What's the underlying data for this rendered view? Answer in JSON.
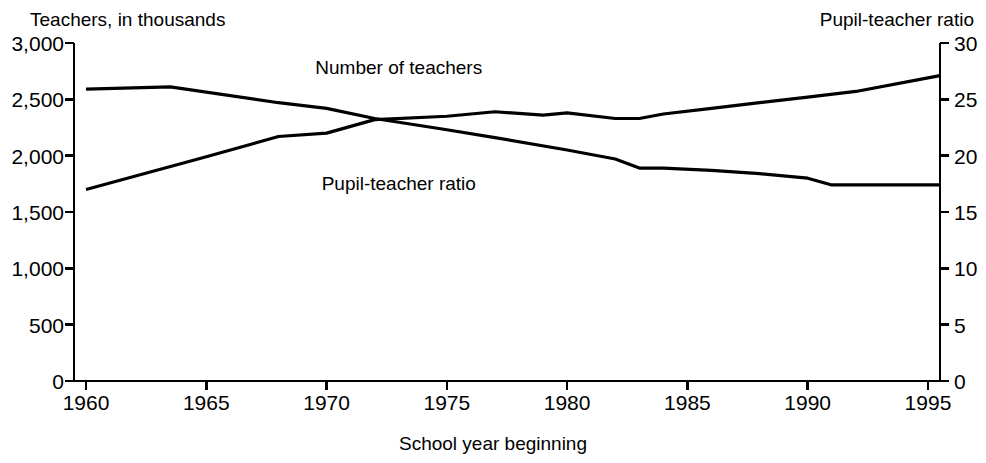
{
  "chart_data": {
    "type": "line",
    "title": "",
    "subtitle": "",
    "xlabel": "School year beginning",
    "ylabel": "Teachers, in thousands",
    "y2label": "Pupil-teacher ratio",
    "grid": false,
    "legend_position": "inline-annotations",
    "xlim": [
      1959.5,
      1995.5
    ],
    "xticks": [
      1960,
      1965,
      1970,
      1975,
      1980,
      1985,
      1990,
      1995
    ],
    "xticklabels": [
      "1960",
      "1965",
      "1970",
      "1975",
      "1980",
      "1985",
      "1990",
      "1995"
    ],
    "ylim": [
      0,
      3000
    ],
    "yticks": [
      0,
      500,
      1000,
      1500,
      2000,
      2500,
      3000
    ],
    "yticklabels": [
      "0",
      "500",
      "1,000",
      "1,500",
      "2,000",
      "2,500",
      "3,000"
    ],
    "y2lim": [
      0,
      30
    ],
    "y2ticks": [
      0,
      5,
      10,
      15,
      20,
      25,
      30
    ],
    "y2ticklabels": [
      "0",
      "5",
      "10",
      "15",
      "20",
      "25",
      "30"
    ],
    "series": [
      {
        "name": "Number of teachers",
        "axis": "left",
        "units": "thousands",
        "color": "#000000",
        "x": [
          1960,
          1965,
          1968,
          1970,
          1972,
          1975,
          1977,
          1979,
          1980,
          1982,
          1983,
          1984,
          1986,
          1988,
          1990,
          1992,
          1995,
          1995.5
        ],
        "values": [
          1700,
          1990,
          2170,
          2200,
          2320,
          2350,
          2390,
          2360,
          2380,
          2330,
          2330,
          2370,
          2420,
          2470,
          2520,
          2570,
          2690,
          2710
        ]
      },
      {
        "name": "Pupil-teacher ratio",
        "axis": "right",
        "units": "pupils per teacher",
        "color": "#000000",
        "x": [
          1960,
          1963.5,
          1968,
          1970,
          1972,
          1975,
          1977,
          1980,
          1982,
          1983,
          1984,
          1986,
          1988,
          1990,
          1991,
          1993,
          1995.5
        ],
        "values": [
          25.9,
          26.1,
          24.7,
          24.2,
          23.3,
          22.3,
          21.6,
          20.5,
          19.7,
          18.9,
          18.9,
          18.7,
          18.4,
          18.0,
          17.4,
          17.4,
          17.4
        ]
      }
    ],
    "annotations": [
      {
        "text": "Number of teachers",
        "x": 1973.0,
        "y_axis": "left",
        "y": 2790
      },
      {
        "text": "Pupil-teacher ratio",
        "x": 1973.0,
        "y_axis": "right",
        "y": 17.6
      }
    ]
  }
}
